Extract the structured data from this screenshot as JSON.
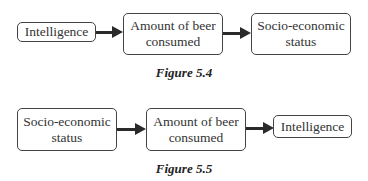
{
  "figures": [
    {
      "caption": "Figure 5.4",
      "nodes": [
        {
          "label": "Intelligence"
        },
        {
          "label": "Amount of beer consumed"
        },
        {
          "label": "Socio-economic status"
        }
      ],
      "edges": [
        {
          "from": "Intelligence",
          "to": "Amount of beer consumed"
        },
        {
          "from": "Amount of beer consumed",
          "to": "Socio-economic status"
        }
      ]
    },
    {
      "caption": "Figure 5.5",
      "nodes": [
        {
          "label": "Socio-economic status"
        },
        {
          "label": "Amount of beer consumed"
        },
        {
          "label": "Intelligence"
        }
      ],
      "edges": [
        {
          "from": "Socio-economic status",
          "to": "Amount of beer consumed"
        },
        {
          "from": "Amount of beer consumed",
          "to": "Intelligence"
        }
      ]
    }
  ]
}
